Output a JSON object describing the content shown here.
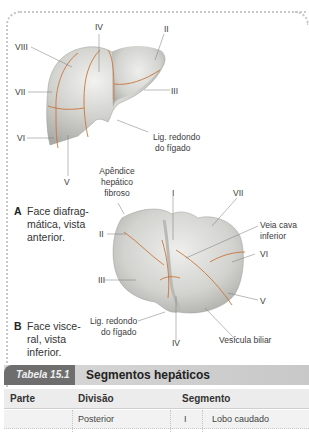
{
  "figure_a": {
    "labels": {
      "iv": "IV",
      "ii": "II",
      "viii": "VIII",
      "vii": "VII",
      "iii": "III",
      "vi": "VI",
      "v": "V",
      "lig_redondo_line1": "Lig. redondo",
      "lig_redondo_line2": "do fígado"
    },
    "caption_letter": "A",
    "caption_text": "Face diafrag-\nmática, vista\nanterior."
  },
  "figure_b": {
    "labels": {
      "apendice_line1": "Apêndice",
      "apendice_line2": "hepático",
      "apendice_line3": "fibroso",
      "i": "I",
      "vii": "VII",
      "ii": "II",
      "veia_line1": "Veia cava",
      "veia_line2": "inferior",
      "vi": "VI",
      "iii": "III",
      "v": "V",
      "lig_redondo_line1": "Lig. redondo",
      "lig_redondo_line2": "do fígado",
      "iv": "IV",
      "vesicula": "Vesícula biliar"
    },
    "caption_letter": "B",
    "caption_text": "Face visce-\nral, vista\ninferior."
  },
  "table": {
    "tab_label": "Tabela 15.1",
    "title": "Segmentos hepáticos",
    "headers": [
      "Parte",
      "Divisão",
      "Segmento"
    ],
    "rows": [
      {
        "parte": "",
        "divisao": "Posterior",
        "segmento_num": "I",
        "segmento_nome": "Lobo caudado"
      }
    ]
  },
  "colors": {
    "segment_line": "#c8753a",
    "liver_fill": "#d5d5d2",
    "tab_bg": "#6e6e6e",
    "title_bar_bg": "#d0d0d0"
  }
}
